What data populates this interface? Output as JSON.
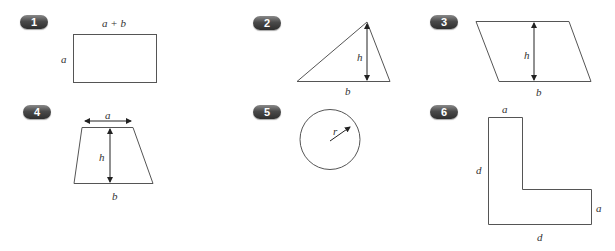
{
  "colors": {
    "stroke": "#555555",
    "badge_top": "#8a8a8a",
    "badge_bottom": "#2e2e2e",
    "badge_text": "#ffffff",
    "label": "#333333"
  },
  "figures": [
    {
      "number": "1",
      "shape": "rectangle",
      "labels": {
        "top": "a + b",
        "left": "a"
      }
    },
    {
      "number": "2",
      "shape": "triangle",
      "labels": {
        "height": "h",
        "base": "b"
      }
    },
    {
      "number": "3",
      "shape": "parallelogram",
      "labels": {
        "height": "h",
        "base": "b"
      }
    },
    {
      "number": "4",
      "shape": "trapezoid",
      "labels": {
        "top": "a",
        "height": "h",
        "base": "b"
      }
    },
    {
      "number": "5",
      "shape": "circle",
      "labels": {
        "radius": "r"
      }
    },
    {
      "number": "6",
      "shape": "L-shape",
      "labels": {
        "top": "a",
        "left": "d",
        "right": "a",
        "bottom": "d"
      }
    }
  ]
}
